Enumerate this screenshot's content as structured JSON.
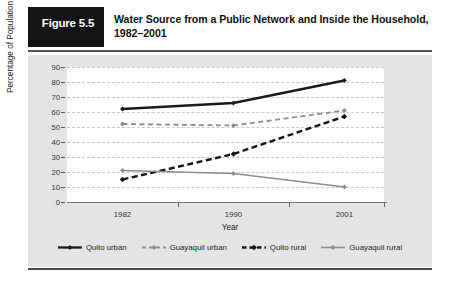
{
  "figure": {
    "badge_label": "Figure 5.5",
    "title": "Water Source from a Public Network and Inside the Household, 1982–2001"
  },
  "chart_data": {
    "type": "line",
    "title": "Water Source from a Public Network and Inside the Household, 1982–2001",
    "xlabel": "Year",
    "ylabel": "Percentage of Population",
    "categories": [
      "1982",
      "1990",
      "2001"
    ],
    "x": [
      1982,
      1990,
      2001
    ],
    "ylim": [
      0,
      90
    ],
    "yticks": [
      0,
      10,
      20,
      30,
      40,
      50,
      60,
      70,
      80,
      90
    ],
    "grid": true,
    "legend_position": "bottom",
    "series": [
      {
        "name": "Quito urban",
        "values": [
          62,
          66,
          81
        ],
        "color": "#1a1a1a",
        "style": "solid",
        "width": 2.3,
        "marker": "diamond"
      },
      {
        "name": "Guayaquil urban",
        "values": [
          52,
          51,
          61
        ],
        "color": "#8c8c8c",
        "style": "dashed",
        "width": 1.8,
        "marker": "diamond"
      },
      {
        "name": "Quito rural",
        "values": [
          15,
          32,
          57
        ],
        "color": "#141414",
        "style": "dashed-bold",
        "width": 2.4,
        "marker": "diamond"
      },
      {
        "name": "Guayaquil rural",
        "values": [
          21,
          19,
          10
        ],
        "color": "#8c8c8c",
        "style": "solid",
        "width": 1.6,
        "marker": "diamond"
      }
    ]
  },
  "colors": {
    "panel_background": "#e4e4e4",
    "plot_background": "#ffffff",
    "gridline": "#c9c9c9",
    "badge_background": "#141414",
    "badge_text": "#ffffff",
    "dark_series": "#1a1a1a",
    "gray_series": "#8c8c8c"
  }
}
